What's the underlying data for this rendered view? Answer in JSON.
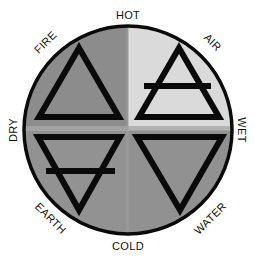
{
  "diagram": {
    "qualities": {
      "top": "HOT",
      "bottom": "COLD",
      "left": "DRY",
      "right": "WET"
    },
    "elements": [
      {
        "name": "FIRE",
        "quadrant": "top-left",
        "qualities": [
          "HOT",
          "DRY"
        ],
        "symbol": "upward triangle",
        "fill": "#8c8c8c"
      },
      {
        "name": "AIR",
        "quadrant": "top-right",
        "qualities": [
          "HOT",
          "WET"
        ],
        "symbol": "upward triangle with horizontal bar",
        "fill": "#dadada"
      },
      {
        "name": "EARTH",
        "quadrant": "bottom-left",
        "qualities": [
          "COLD",
          "DRY"
        ],
        "symbol": "downward triangle with horizontal bar",
        "fill": "#929292"
      },
      {
        "name": "WATER",
        "quadrant": "bottom-right",
        "qualities": [
          "COLD",
          "WET"
        ],
        "symbol": "downward triangle",
        "fill": "#929292"
      }
    ],
    "colors": {
      "outline": "#0a0a0a",
      "divider": "#a8a8a8",
      "background": "#ffffff"
    }
  }
}
